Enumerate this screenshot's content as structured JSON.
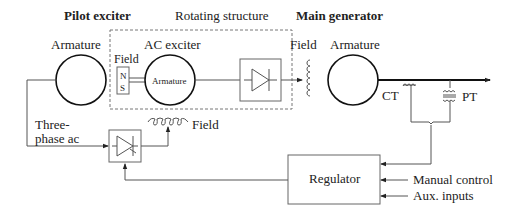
{
  "headers": {
    "pilot_exciter": "Pilot exciter",
    "rotating_structure": "Rotating structure",
    "main_generator": "Main generator"
  },
  "labels": {
    "pilot_armature": "Armature",
    "ac_exciter": "AC exciter",
    "exciter_field": "Field",
    "pole_n": "N",
    "pole_s": "S",
    "exciter_armature": "Armature",
    "rotating_field": "Field",
    "main_armature": "Armature",
    "ct": "CT",
    "pt": "PT",
    "three_phase_line1": "Three-",
    "three_phase_line2": "phase ac",
    "pilot_field": "Field",
    "regulator": "Regulator",
    "manual_control": "Manual control",
    "aux_inputs": "Aux. inputs"
  },
  "colors": {
    "line": "#555555",
    "bold_line": "#111111",
    "dashed_box": "#777777"
  }
}
